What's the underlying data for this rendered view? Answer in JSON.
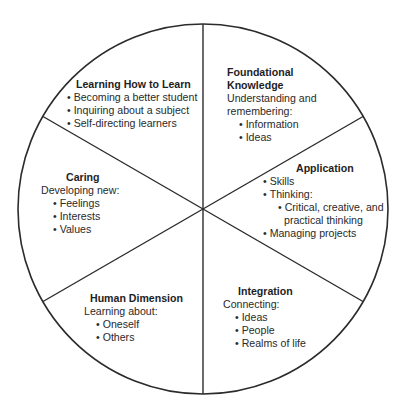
{
  "diagram": {
    "type": "wheel",
    "segments_count": 6,
    "colors": {
      "stroke": "#2b2b2b",
      "text": "#2a2a2a",
      "background": "#ffffff"
    },
    "segments": [
      {
        "id": "learning-how-to-learn",
        "title": "Learning How to Learn",
        "items": [
          "Becoming a better student",
          "Inquiring about a subject",
          "Self-directing learners"
        ]
      },
      {
        "id": "foundational-knowledge",
        "title_line1": "Foundational",
        "title_line2": "Knowledge",
        "intro_line1": "Understanding and",
        "intro_line2": "remembering:",
        "items": [
          "Information",
          "Ideas"
        ]
      },
      {
        "id": "application",
        "title": "Application",
        "items": [
          "Skills",
          "Thinking:",
          "Critical, creative, and",
          "practical thinking",
          "Managing projects"
        ]
      },
      {
        "id": "integration",
        "title": "Integration",
        "intro": "Connecting:",
        "items": [
          "Ideas",
          "People",
          "Realms of life"
        ]
      },
      {
        "id": "human-dimension",
        "title": "Human Dimension",
        "intro": "Learning about:",
        "items": [
          "Oneself",
          "Others"
        ]
      },
      {
        "id": "caring",
        "title": "Caring",
        "intro": "Developing new:",
        "items": [
          "Feelings",
          "Interests",
          "Values"
        ]
      }
    ]
  }
}
